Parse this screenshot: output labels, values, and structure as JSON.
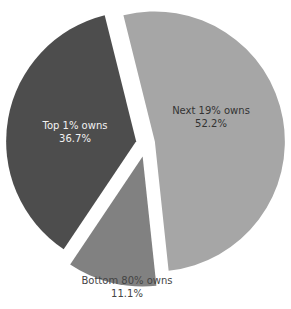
{
  "chart_data": {
    "type": "pie",
    "title": "",
    "exploded": true,
    "slices": [
      {
        "label": "Next 19% owns",
        "value": 52.2,
        "value_label": "52.2%",
        "color": "#a6a6a6",
        "text_color": "#333333"
      },
      {
        "label": "Bottom 80% owns",
        "value": 11.1,
        "value_label": "11.1%",
        "color": "#818181",
        "text_color": "#444444"
      },
      {
        "label": "Top 1% owns",
        "value": 36.7,
        "value_label": "36.7%",
        "color": "#4d4d4d",
        "text_color": "#f2f2f2"
      }
    ],
    "legend": "none"
  }
}
